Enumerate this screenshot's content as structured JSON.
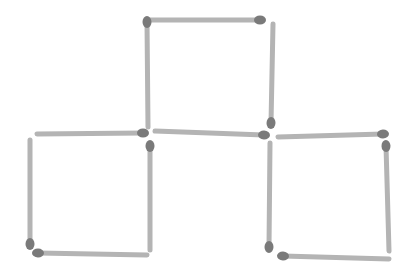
{
  "diagram": {
    "title": "",
    "type": "matchstick-puzzle",
    "colors": {
      "background": "#ffffff",
      "stick": "#b4b4b4",
      "head": "#7a7a7a"
    },
    "stick_width": 5,
    "head_radius": 5,
    "matches": [
      {
        "id": "top-square-top",
        "x1": 150,
        "y1": 20,
        "x2": 260,
        "y2": 20,
        "head": "end"
      },
      {
        "id": "top-square-left",
        "x1": 147,
        "y1": 22,
        "x2": 148,
        "y2": 127,
        "head": "start"
      },
      {
        "id": "top-square-right",
        "x1": 273,
        "y1": 24,
        "x2": 271,
        "y2": 123,
        "head": "end"
      },
      {
        "id": "middle-shared",
        "x1": 155,
        "y1": 131,
        "x2": 264,
        "y2": 135,
        "head": "end"
      },
      {
        "id": "bottom-left-top",
        "x1": 37,
        "y1": 134,
        "x2": 143,
        "y2": 133,
        "head": "end"
      },
      {
        "id": "bottom-left-left",
        "x1": 30,
        "y1": 140,
        "x2": 30,
        "y2": 244,
        "head": "end"
      },
      {
        "id": "bottom-left-right",
        "x1": 150,
        "y1": 146,
        "x2": 150,
        "y2": 250,
        "head": "start"
      },
      {
        "id": "bottom-left-bottom",
        "x1": 38,
        "y1": 253,
        "x2": 147,
        "y2": 255,
        "head": "start"
      },
      {
        "id": "bottom-right-top",
        "x1": 278,
        "y1": 137,
        "x2": 383,
        "y2": 134,
        "head": "end"
      },
      {
        "id": "bottom-right-left",
        "x1": 270,
        "y1": 143,
        "x2": 269,
        "y2": 247,
        "head": "end"
      },
      {
        "id": "bottom-right-right",
        "x1": 386,
        "y1": 146,
        "x2": 389,
        "y2": 251,
        "head": "start"
      },
      {
        "id": "bottom-right-bottom",
        "x1": 283,
        "y1": 256,
        "x2": 389,
        "y2": 259,
        "head": "start"
      }
    ]
  }
}
